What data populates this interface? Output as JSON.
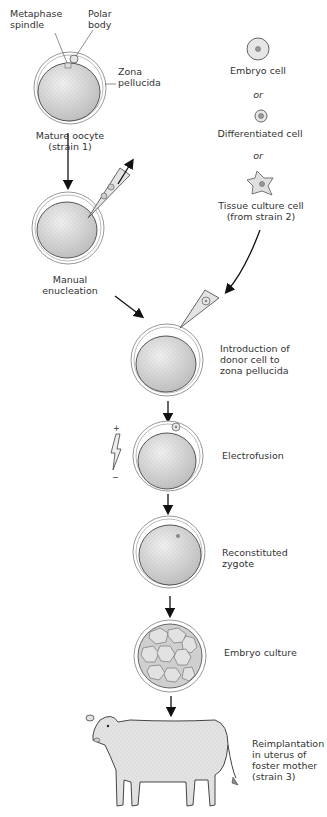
{
  "diagram": {
    "type": "process-flow"
  },
  "labels": {
    "metaphase_spindle": [
      "Metaphase",
      "spindle"
    ],
    "polar_body": [
      "Polar",
      "body"
    ],
    "zona_pellucida": [
      "Zona",
      "pellucida"
    ],
    "mature_oocyte": [
      "Mature oocyte",
      "(strain 1)"
    ],
    "manual_enucleation": [
      "Manual",
      "enucleation"
    ]
  },
  "donor_options": {
    "embryo_cell": "Embryo cell",
    "or_1": "or",
    "differentiated_cell": "Differentiated cell",
    "or_2": "or",
    "tissue_culture_cell": [
      "Tissue culture cell",
      "(from strain 2)"
    ]
  },
  "steps": [
    {
      "id": "introduction",
      "lines": [
        "Introduction of",
        "donor cell to",
        "zona pellucida"
      ]
    },
    {
      "id": "electrofusion",
      "lines": [
        "Electrofusion"
      ]
    },
    {
      "id": "reconstituted",
      "lines": [
        "Reconstituted",
        "zygote"
      ]
    },
    {
      "id": "embryo_culture",
      "lines": [
        "Embryo culture"
      ]
    },
    {
      "id": "reimplantation",
      "lines": [
        "Reimplantation",
        "in uterus of",
        "foster mother",
        "(strain 3)"
      ]
    }
  ],
  "electrofusion_symbol": {
    "plus": "+",
    "minus": "−"
  }
}
